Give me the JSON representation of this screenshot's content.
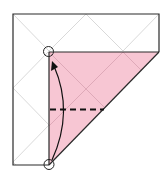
{
  "diagram": {
    "type": "origami-fold-step",
    "colors": {
      "background": "#ffffff",
      "paper_white": "#ffffff",
      "paper_colored": "#f7c6d3",
      "outline": "#222222",
      "crease": "#c8c8c8",
      "crease_on_color": "#d9a3b2",
      "valley_fold_line": "#111111",
      "arrow": "#111111",
      "marker_circle": "#222222"
    },
    "elements": {
      "outer_paper": "square sheet, white side up",
      "folded_flap": "pink triangular/trapezoid flap",
      "valley_fold": "dashed horizontal valley-fold line",
      "fold_arrow": "curved arrow bringing bottom point up to top point",
      "reference_points": [
        "top circle marker",
        "bottom circle marker"
      ]
    }
  }
}
